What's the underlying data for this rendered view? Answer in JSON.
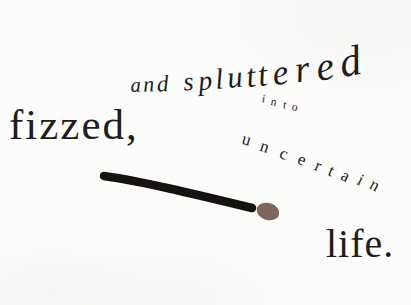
{
  "page": {
    "background": "#fcfcfb",
    "ink": "#201d1b"
  },
  "typography": {
    "word_fizzed": "fizzed,",
    "phrase_and_spluttered": "and spluttered",
    "word_into": "into",
    "word_uncertain": "uncertain",
    "word_life": "life."
  },
  "match": {
    "stick_color": "#151210",
    "head_color": "#7d655b"
  }
}
